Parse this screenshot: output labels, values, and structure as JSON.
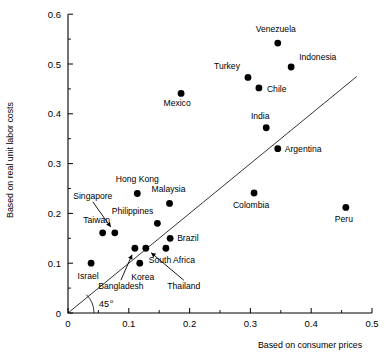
{
  "chart_data": {
    "type": "scatter",
    "title": "",
    "xlabel": "Based on consumer prices",
    "ylabel": "Based on real unit labor costs",
    "xlim": [
      0,
      0.5
    ],
    "ylim": [
      0,
      0.6
    ],
    "xticks": [
      "0",
      "0.1",
      "0.2",
      "0.3",
      "0.4",
      "0.5"
    ],
    "xtick_values": [
      0,
      0.1,
      0.2,
      0.3,
      0.4,
      0.5
    ],
    "yticks": [
      "0",
      "0.1",
      "0.2",
      "0.3",
      "0.4",
      "0.5",
      "0.6"
    ],
    "ytick_values": [
      0,
      0.1,
      0.2,
      0.3,
      0.4,
      0.5,
      0.6
    ],
    "grid": false,
    "legend": null,
    "annotations": [
      {
        "text": "45",
        "superscript": "o",
        "name": "forty-five-degree-annotation"
      }
    ],
    "reference_line": {
      "name": "45-degree-line",
      "from": [
        0,
        0
      ],
      "to": [
        0.475,
        0.475
      ]
    },
    "points": [
      {
        "label": "Venezuela",
        "x": 0.345,
        "y": 0.542,
        "label_dx": -2,
        "label_dy": -11,
        "anchor": "middle"
      },
      {
        "label": "Indonesia",
        "x": 0.367,
        "y": 0.494,
        "label_dx": 8,
        "label_dy": -7,
        "anchor": "start"
      },
      {
        "label": "Turkey",
        "x": 0.296,
        "y": 0.473,
        "label_dx": -8,
        "label_dy": -8,
        "anchor": "end"
      },
      {
        "label": "Chile",
        "x": 0.314,
        "y": 0.452,
        "label_dx": 8,
        "label_dy": 4,
        "anchor": "start"
      },
      {
        "label": "Mexico",
        "x": 0.186,
        "y": 0.441,
        "label_dx": -4,
        "label_dy": 13,
        "anchor": "middle"
      },
      {
        "label": "India",
        "x": 0.326,
        "y": 0.372,
        "label_dx": -6,
        "label_dy": -9,
        "anchor": "middle"
      },
      {
        "label": "Argentina",
        "x": 0.345,
        "y": 0.33,
        "label_dx": 7,
        "label_dy": 3,
        "anchor": "start"
      },
      {
        "label": "Hong Kong",
        "x": 0.114,
        "y": 0.24,
        "label_dx": 0,
        "label_dy": -11,
        "anchor": "middle"
      },
      {
        "label": "Malaysia",
        "x": 0.167,
        "y": 0.22,
        "label_dx": -1,
        "label_dy": -11,
        "anchor": "middle"
      },
      {
        "label": "Colombia",
        "x": 0.306,
        "y": 0.241,
        "label_dx": -3,
        "label_dy": 15,
        "anchor": "middle"
      },
      {
        "label": "Peru",
        "x": 0.457,
        "y": 0.212,
        "label_dx": -2,
        "label_dy": 15,
        "anchor": "middle"
      },
      {
        "label": "Philippines",
        "x": 0.147,
        "y": 0.18,
        "label_dx": -4,
        "label_dy": -9,
        "anchor": "end"
      },
      {
        "label": "Taiwan",
        "x": 0.057,
        "y": 0.161,
        "label_dx": -6,
        "label_dy": -10,
        "anchor": "middle"
      },
      {
        "label": "Singapore",
        "x": 0.077,
        "y": 0.161,
        "label_dx": -22,
        "label_dy": -34,
        "anchor": "middle",
        "leader": true
      },
      {
        "label": "Brazil",
        "x": 0.168,
        "y": 0.15,
        "label_dx": 7,
        "label_dy": 3,
        "anchor": "start"
      },
      {
        "label": "Bangladesh",
        "x": 0.11,
        "y": 0.13,
        "label_dx": -14,
        "label_dy": 41,
        "anchor": "middle",
        "leader": true
      },
      {
        "label": "Thailand",
        "x": 0.128,
        "y": 0.13,
        "label_dx": 38,
        "label_dy": 41,
        "anchor": "middle",
        "leader": true
      },
      {
        "label": "South Africa",
        "x": 0.161,
        "y": 0.13,
        "label_dx": 6,
        "label_dy": 15,
        "anchor": "middle"
      },
      {
        "label": "Korea",
        "x": 0.118,
        "y": 0.1,
        "label_dx": 3,
        "label_dy": 17,
        "anchor": "middle"
      },
      {
        "label": "Israel",
        "x": 0.038,
        "y": 0.1,
        "label_dx": -3,
        "label_dy": 16,
        "anchor": "middle"
      }
    ]
  },
  "geometry": {
    "x0_px": 68,
    "y0_px": 313,
    "x_per_unit_px": 608,
    "y_per_unit_px": 498,
    "dot_radius": 3.4
  }
}
